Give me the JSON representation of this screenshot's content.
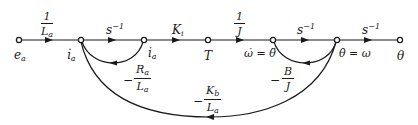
{
  "diagram": {
    "type": "signal-flow-graph",
    "nodes": [
      {
        "id": "ea",
        "label": "e",
        "sub": "a",
        "x": 19
      },
      {
        "id": "ia_dot",
        "label": "i̇",
        "sub": "a",
        "x": 81
      },
      {
        "id": "ia",
        "label": "i",
        "sub": "a",
        "x": 144
      },
      {
        "id": "T",
        "label": "T",
        "x": 208
      },
      {
        "id": "omega_dot",
        "label": "ω̇ = θ̈",
        "x": 273
      },
      {
        "id": "theta_dot",
        "label": "θ̇ = ω",
        "x": 337
      },
      {
        "id": "theta",
        "label": "θ",
        "x": 400
      }
    ],
    "forward_branches": [
      {
        "from": "ea",
        "to": "ia_dot",
        "gain_num": "1",
        "gain_den": "L",
        "gain_den_sub": "a"
      },
      {
        "from": "ia_dot",
        "to": "ia",
        "gain": "s",
        "gain_sup": "−1"
      },
      {
        "from": "ia",
        "to": "T",
        "gain": "K",
        "gain_sub": "i"
      },
      {
        "from": "T",
        "to": "omega_dot",
        "gain_num": "1",
        "gain_den": "J"
      },
      {
        "from": "omega_dot",
        "to": "theta_dot",
        "gain": "s",
        "gain_sup": "−1"
      },
      {
        "from": "theta_dot",
        "to": "theta",
        "gain": "s",
        "gain_sup": "−1"
      }
    ],
    "feedback_branches": [
      {
        "from": "ia",
        "to": "ia_dot",
        "sign": "−",
        "gain_num": "R",
        "gain_num_sub": "a",
        "gain_den": "L",
        "gain_den_sub": "a"
      },
      {
        "from": "theta_dot",
        "to": "omega_dot",
        "sign": "−",
        "gain_num": "B",
        "gain_den": "J"
      },
      {
        "from": "theta_dot",
        "to": "ia_dot",
        "sign": "−",
        "gain_num": "K",
        "gain_num_sub": "b",
        "gain_den": "L",
        "gain_den_sub": "a"
      }
    ],
    "colors": {
      "line": "#1a1a1a",
      "background": "#ffffff"
    }
  }
}
